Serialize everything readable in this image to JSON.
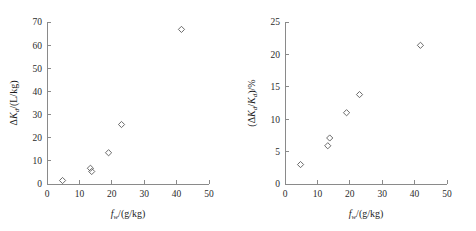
{
  "figure": {
    "background_color": "#ffffff",
    "axis_color": "#8a8a8a",
    "marker_color": "#5a5a5a",
    "text_color": "#1d1d1d"
  },
  "chart_data": [
    {
      "type": "scatter",
      "panel": "left",
      "title": "",
      "xlabel": "f_w/(g/kg)",
      "ylabel": "ΔK_d/(L/kg)",
      "xlabel_parts": {
        "sym": "f",
        "sub": "w",
        "unit": "/(g/kg)"
      },
      "ylabel_parts": {
        "delta": "Δ",
        "sym": "K",
        "sub": "d",
        "unit": "/(L/kg)"
      },
      "xlim": [
        0,
        50
      ],
      "ylim": [
        0,
        70
      ],
      "xticks": [
        0,
        10,
        20,
        30,
        40,
        50
      ],
      "yticks": [
        0,
        10,
        20,
        30,
        40,
        50,
        60,
        70
      ],
      "xtick_labels": [
        "0",
        "10",
        "20",
        "30",
        "40",
        "50"
      ],
      "ytick_labels": [
        "0",
        "10",
        "20",
        "30",
        "40",
        "50",
        "60",
        "70"
      ],
      "grid": false,
      "legend": false,
      "marker": "open-diamond",
      "x": [
        4.8,
        13.4,
        13.8,
        19.0,
        23.0,
        41.5
      ],
      "y": [
        1.5,
        6.8,
        5.4,
        13.5,
        25.7,
        66.8
      ]
    },
    {
      "type": "scatter",
      "panel": "right",
      "title": "",
      "xlabel": "f_w/(g/kg)",
      "ylabel": "(ΔK_d/K_d)/%",
      "xlabel_parts": {
        "sym": "f",
        "sub": "w",
        "unit": "/(g/kg)"
      },
      "ylabel_parts": {
        "open": "(",
        "delta": "Δ",
        "sym": "K",
        "sub": "d",
        "slash": "/",
        "sym2": "K",
        "sub2": "d",
        "close": ")",
        "unit": "/%"
      },
      "xlim": [
        0,
        50
      ],
      "ylim": [
        0,
        25
      ],
      "xticks": [
        0,
        10,
        20,
        30,
        40,
        50
      ],
      "yticks": [
        0,
        5,
        10,
        15,
        20,
        25
      ],
      "xtick_labels": [
        "0",
        "10",
        "20",
        "30",
        "40",
        "50"
      ],
      "ytick_labels": [
        "0",
        "5",
        "10",
        "15",
        "20",
        "25"
      ],
      "grid": false,
      "legend": false,
      "marker": "open-diamond",
      "x": [
        4.8,
        13.2,
        13.8,
        19.0,
        23.0,
        41.8
      ],
      "y": [
        3.0,
        5.9,
        7.1,
        11.0,
        13.8,
        21.4
      ]
    }
  ]
}
